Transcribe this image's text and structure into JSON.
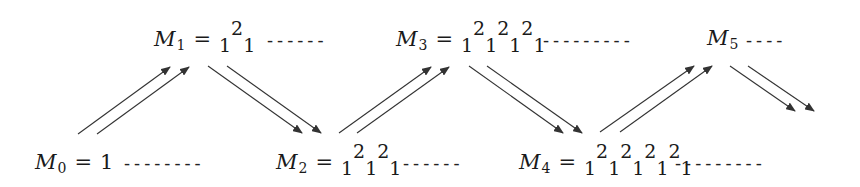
{
  "nodes": [
    {
      "id": "M0",
      "label": "M",
      "subscript": "0",
      "equals": "=",
      "value": "1",
      "top_row": "",
      "bottom_row": "",
      "dashes": "--------"
    },
    {
      "id": "M1",
      "label": "M",
      "subscript": "1",
      "equals": "=",
      "top_row": "2",
      "bottom_row": "1 1",
      "dashes": "------"
    },
    {
      "id": "M2",
      "label": "M",
      "subscript": "2",
      "equals": "=",
      "top_row": "2 2",
      "bottom_row": "1 1 1",
      "dashes": "------"
    },
    {
      "id": "M3",
      "label": "M",
      "subscript": "3",
      "equals": "=",
      "top_row": "2 2 2",
      "bottom_row": "1 1 1 1",
      "dashes": "---------"
    },
    {
      "id": "M4",
      "label": "M",
      "subscript": "4",
      "equals": "=",
      "top_row": "2 2 2 2",
      "bottom_row": "1 1 1 1 1",
      "dashes": "---------",
      "leading_dashes": "------"
    },
    {
      "id": "M5",
      "label": "M",
      "subscript": "5",
      "dashes": "----"
    }
  ],
  "edges": [
    {
      "from": "M0",
      "to": "M1",
      "direction": "up",
      "count": 2
    },
    {
      "from": "M1",
      "to": "M2",
      "direction": "down",
      "count": 2
    },
    {
      "from": "M2",
      "to": "M3",
      "direction": "up",
      "count": 2
    },
    {
      "from": "M3",
      "to": "M4",
      "direction": "down",
      "count": 2
    },
    {
      "from": "M4",
      "to": "M5",
      "direction": "up",
      "count": 2
    },
    {
      "from": "M5",
      "to": "next",
      "direction": "down",
      "count": 2
    }
  ],
  "colors": {
    "ink": "#1a1a1a",
    "arrow": "#333333",
    "background": "#ffffff"
  }
}
